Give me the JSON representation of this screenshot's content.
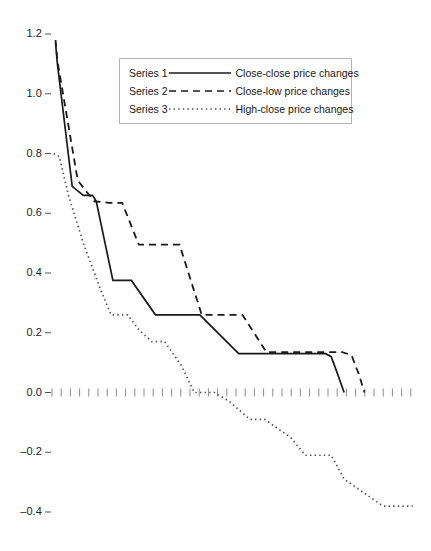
{
  "chart_data": {
    "type": "line",
    "title": "",
    "subtitle": "",
    "xlabel": "",
    "ylabel": "",
    "grid": false,
    "legend_position": "top-center",
    "ylim": [
      -0.45,
      1.25
    ],
    "xlim": [
      0,
      100
    ],
    "ytick_labels": [
      "1.2",
      "1.0",
      "0.8",
      "0.6",
      "0.4",
      "0.2",
      "0.0",
      "-0.2",
      "-0.4"
    ],
    "ytick_values": [
      1.2,
      1.0,
      0.8,
      0.6,
      0.4,
      0.2,
      0.0,
      -0.2,
      -0.4
    ],
    "xtick_labels": [],
    "zero_axis": {
      "value": 0.0,
      "style": "dotted-ticks"
    },
    "series": [
      {
        "name": "Series 1",
        "label": "Close-close price changes",
        "style": "solid",
        "color": "#1a1a1a",
        "x": [
          1.5,
          2.0,
          6.0,
          9.0,
          11.5,
          12.5,
          17.0,
          19.0,
          21.0,
          22.0,
          28.5,
          30.0,
          35.0,
          36.5,
          39.0,
          40.5,
          51.0,
          52.5,
          74.5,
          76.0,
          77.5,
          79.5
        ],
        "y": [
          1.17,
          1.1,
          0.69,
          0.66,
          0.66,
          0.64,
          0.375,
          0.375,
          0.375,
          0.375,
          0.26,
          0.26,
          0.26,
          0.26,
          0.26,
          0.26,
          0.13,
          0.13,
          0.13,
          0.12,
          0.07,
          0.0
        ]
      },
      {
        "name": "Series 2",
        "label": "Close-low price changes",
        "style": "dashed",
        "color": "#1a1a1a",
        "x": [
          1.5,
          2.0,
          7.5,
          10.0,
          12.0,
          16.0,
          19.5,
          24.0,
          27.0,
          32.0,
          35.0,
          41.0,
          47.0,
          52.0,
          58.5,
          61.0,
          79.0,
          81.5,
          83.5,
          85.0
        ],
        "y": [
          1.18,
          1.11,
          0.71,
          0.67,
          0.64,
          0.635,
          0.635,
          0.495,
          0.495,
          0.495,
          0.495,
          0.26,
          0.26,
          0.26,
          0.135,
          0.135,
          0.135,
          0.125,
          0.06,
          0.0
        ]
      },
      {
        "name": "Series 3",
        "label": "High-close price changes",
        "style": "dotted",
        "color": "#4d4d4d",
        "x": [
          1.0,
          2.5,
          5.0,
          9.0,
          13.5,
          16.5,
          21.0,
          24.0,
          27.5,
          31.0,
          35.5,
          39.0,
          44.5,
          48.5,
          54.0,
          58.0,
          65.0,
          69.0,
          76.0,
          79.5,
          90.0,
          98.0
        ],
        "y": [
          0.8,
          0.79,
          0.66,
          0.5,
          0.35,
          0.26,
          0.26,
          0.21,
          0.17,
          0.17,
          0.09,
          0.0,
          0.0,
          -0.03,
          -0.09,
          -0.09,
          -0.15,
          -0.21,
          -0.21,
          -0.29,
          -0.38,
          -0.38
        ]
      }
    ]
  },
  "legend": {
    "rows": [
      {
        "name": "Series 1",
        "label": "Close-close price changes",
        "style": "solid"
      },
      {
        "name": "Series 2",
        "label": "Close-low price changes",
        "style": "dashed"
      },
      {
        "name": "Series 3",
        "label": "High-close price changes",
        "style": "dotted"
      }
    ]
  },
  "axis": {
    "y_labels": [
      "1.2",
      "1.0",
      "0.8",
      "0.6",
      "0.4",
      "0.2",
      "0.0",
      "-0.2",
      "-0.4"
    ]
  },
  "colors": {
    "ink": "#1a1a1a",
    "dotted": "#4d4d4d",
    "legend_border": "#b4b4b4",
    "background": "#ffffff"
  }
}
